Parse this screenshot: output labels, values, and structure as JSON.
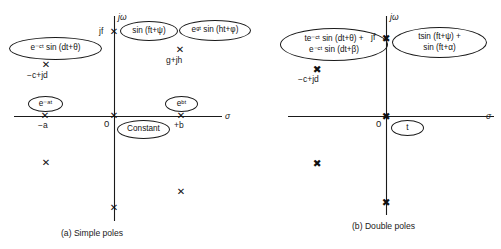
{
  "figure": {
    "panels": [
      {
        "id": "a",
        "caption": "(a) Simple poles",
        "axis_real_label": "σ",
        "axis_imag_label": "jω",
        "origin_label": "0",
        "imag_tick_label": "jf",
        "point_labels": [
          {
            "name": "neg-a",
            "text": "−a"
          },
          {
            "name": "pos-b",
            "text": "+b"
          },
          {
            "name": "neg-c-plus-jd",
            "text": "−c+jd"
          },
          {
            "name": "g-plus-jh",
            "text": "g+jh"
          }
        ],
        "bubbles": [
          {
            "name": "exp-decay-sine",
            "lines": [
              "e⁻ᶜᵗ sin (dt+θ)"
            ]
          },
          {
            "name": "sine",
            "lines": [
              "sin (ft+ψ)"
            ]
          },
          {
            "name": "exp-growth-sine",
            "lines": [
              "eᵍᵗ sin (ht+φ)"
            ]
          },
          {
            "name": "exp-decay",
            "lines": [
              "e⁻ᵃᵗ"
            ]
          },
          {
            "name": "exp-growth",
            "lines": [
              "eᵇᵗ"
            ]
          },
          {
            "name": "constant",
            "lines": [
              "Constant"
            ]
          }
        ]
      },
      {
        "id": "b",
        "caption": "(b) Double poles",
        "axis_real_label": "σ",
        "axis_imag_label": "jω",
        "origin_label": "0",
        "imag_tick_label": "jf",
        "point_labels": [
          {
            "name": "neg-c-plus-jd",
            "text": "−c+jd"
          }
        ],
        "bubbles": [
          {
            "name": "t-exp-decay-sine-sum",
            "lines": [
              "te⁻ᶜᵗ sin (dt+θ) +",
              "e⁻ᶜᵗ sin (dt+β)"
            ]
          },
          {
            "name": "t-sine-sum",
            "lines": [
              "tsin (ft+ψ) +",
              "sin (ft+α)"
            ]
          },
          {
            "name": "ramp-t",
            "lines": [
              "t"
            ]
          }
        ]
      }
    ]
  }
}
